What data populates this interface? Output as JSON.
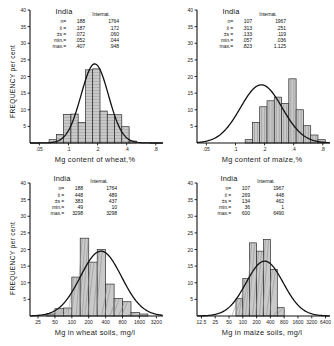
{
  "figure": {
    "axis_label_y": "FREQUENCY per cent",
    "col_header_india": "India",
    "col_header_intl": "Internat.",
    "stat_labels": {
      "n": "n=",
      "mean": "x̄ =",
      "sd": "±s =",
      "min": "min.=",
      "max": "max.="
    }
  },
  "chart_data": [
    {
      "id": "wheat-mg-content",
      "type": "bar",
      "title": "",
      "xlabel": "Mg content of wheat,%",
      "ylabel": "FREQUENCY per cent",
      "xscale": "log",
      "xticks": [
        ".05",
        ".1",
        ".2",
        ".4",
        ".8"
      ],
      "xtick_values": [
        0.05,
        0.1,
        0.2,
        0.4,
        0.8
      ],
      "yticks": [
        0,
        5,
        10,
        15,
        20,
        25,
        30,
        35,
        40
      ],
      "ylim": [
        0,
        40
      ],
      "xlim": [
        0.04,
        0.95
      ],
      "grid": false,
      "bar_edges": [
        0.063,
        0.075,
        0.089,
        0.106,
        0.126,
        0.15,
        0.178,
        0.212,
        0.252,
        0.3,
        0.356,
        0.424,
        0.504
      ],
      "values": [
        1.0,
        2.6,
        8.6,
        8.7,
        6.2,
        22.0,
        22.3,
        9.6,
        8.6,
        8.5,
        4.9,
        0.6
      ],
      "curve": {
        "label": "normal distribution overlay",
        "peak_value": 23.8,
        "peak_x": 0.187,
        "sd": 0.072
      },
      "stats": {
        "india": {
          "n": "188",
          "mean": ".187",
          "sd": ".072",
          "min": ".052",
          "max": ".407"
        },
        "internat": {
          "n": "1764",
          "mean": ".172",
          "sd": ".060",
          "min": ".044",
          "max": ".948"
        }
      }
    },
    {
      "id": "maize-mg-content",
      "type": "bar",
      "title": "",
      "xlabel": "Mg content of maize,%",
      "ylabel": "FREQUENCY per cent",
      "xscale": "log",
      "xticks": [
        ".05",
        ".1",
        ".2",
        ".4",
        ".8"
      ],
      "xtick_values": [
        0.05,
        0.1,
        0.2,
        0.4,
        0.8
      ],
      "yticks": [
        0,
        5,
        10,
        15,
        20,
        25,
        30,
        35,
        40
      ],
      "ylim": [
        0,
        40
      ],
      "xlim": [
        0.04,
        0.95
      ],
      "grid": false,
      "bar_edges": [
        0.126,
        0.15,
        0.178,
        0.212,
        0.252,
        0.3,
        0.356,
        0.424,
        0.504,
        0.6,
        0.713,
        0.848
      ],
      "values": [
        1.0,
        6.2,
        10.9,
        12.7,
        13.8,
        11.9,
        19.3,
        10.0,
        5.2,
        2.4,
        1.0
      ],
      "curve": {
        "label": "normal distribution overlay",
        "peak_value": 17.5,
        "peak_x": 0.185,
        "sd": 0.119
      },
      "stats": {
        "india": {
          "n": "107",
          "mean": ".313",
          "sd": ".133",
          "min": ".057",
          "max": ".823"
        },
        "internat": {
          "n": "1967",
          "mean": ".251",
          "sd": ".119",
          "min": ".036",
          "max": "1.125"
        }
      }
    },
    {
      "id": "wheat-soils-mg",
      "type": "bar",
      "title": "",
      "xlabel": "Mg in wheat soils, mg/l",
      "ylabel": "FREQUENCY per cent",
      "xscale": "log",
      "xticks": [
        "25",
        "50",
        "100",
        "200",
        "400",
        "800",
        "1600",
        "3200"
      ],
      "xtick_values": [
        25,
        50,
        100,
        200,
        400,
        800,
        1600,
        3200
      ],
      "yticks": [
        0,
        5,
        10,
        15,
        20,
        25,
        30,
        35,
        40
      ],
      "ylim": [
        0,
        40
      ],
      "xlim": [
        18,
        4200
      ],
      "grid": false,
      "bar_edges": [
        35,
        50,
        71,
        100,
        141,
        200,
        283,
        400,
        566,
        800,
        1131,
        1600,
        2263
      ],
      "values": [
        0.6,
        2.2,
        2.4,
        11.7,
        23.4,
        16.2,
        20.0,
        9.6,
        5.3,
        4.3,
        1.1,
        0.6
      ],
      "curve": {
        "label": "normal distribution overlay",
        "peak_value": 19.5,
        "peak_x": 330,
        "sd": 437
      },
      "stats": {
        "india": {
          "n": "188",
          "mean": "448",
          "sd": "383",
          "min": "49",
          "max": "3298"
        },
        "internat": {
          "n": "1764",
          "mean": "489",
          "sd": "437",
          "min": "10",
          "max": "3298"
        }
      }
    },
    {
      "id": "maize-soils-mg",
      "type": "bar",
      "title": "",
      "xlabel": "Mg in maize soils, mg/l",
      "ylabel": "FREQUENCY per cent",
      "xscale": "log",
      "xticks": [
        "12.5",
        "25",
        "50",
        "100",
        "200",
        "400",
        "800",
        "1600",
        "3200",
        "6400"
      ],
      "xtick_values": [
        12.5,
        25,
        50,
        100,
        200,
        400,
        800,
        1600,
        3200,
        6400
      ],
      "yticks": [
        0,
        5,
        10,
        15,
        20,
        25,
        30,
        35,
        40
      ],
      "ylim": [
        0,
        40
      ],
      "xlim": [
        10,
        8000
      ],
      "grid": false,
      "bar_edges": [
        71,
        100,
        141,
        200,
        283,
        400,
        566,
        800
      ],
      "values": [
        5.2,
        11.3,
        22.0,
        19.5,
        23.0,
        14.0,
        2.5
      ],
      "curve": {
        "label": "normal distribution overlay",
        "peak_value": 16.5,
        "peak_x": 300,
        "sd": 462
      },
      "stats": {
        "india": {
          "n": "107",
          "mean": "269",
          "sd": "134",
          "min": "36",
          "max": "600"
        },
        "internat": {
          "n": "1967",
          "mean": "448",
          "sd": "462",
          "min": "1",
          "max": "6490"
        }
      }
    }
  ]
}
